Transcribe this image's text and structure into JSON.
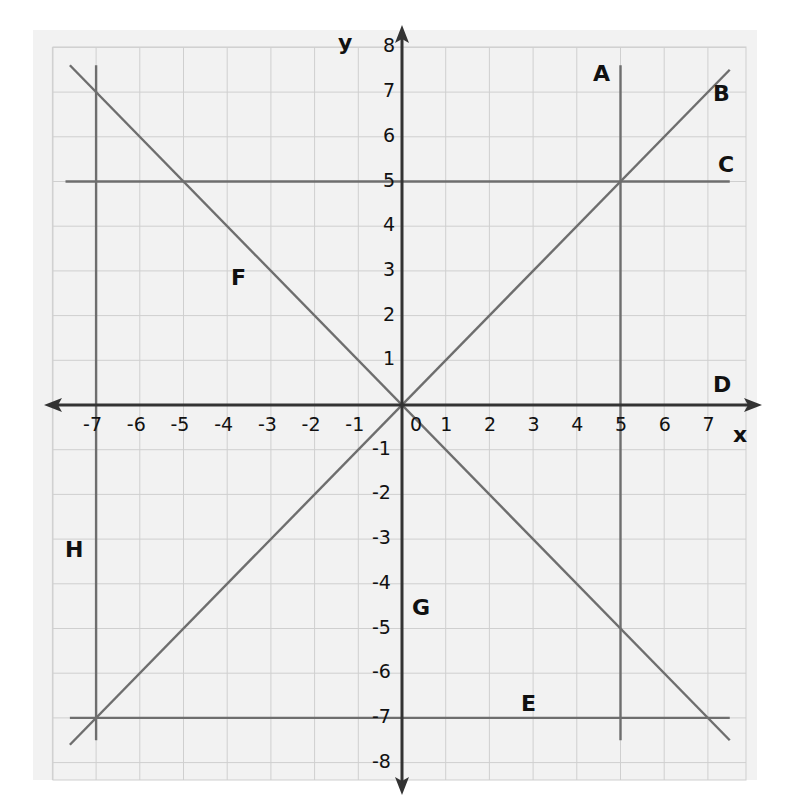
{
  "chart_data": {
    "type": "line",
    "title": "",
    "xlabel": "x",
    "ylabel": "y",
    "xlim": [
      -8,
      8
    ],
    "ylim": [
      -8,
      8
    ],
    "grid": true,
    "x_ticks": [
      "-7",
      "-6",
      "-5",
      "-4",
      "-3",
      "-2",
      "-1",
      "0",
      "1",
      "2",
      "3",
      "4",
      "5",
      "6",
      "7"
    ],
    "y_ticks": [
      "8",
      "7",
      "6",
      "5",
      "4",
      "3",
      "2",
      "1",
      "-1",
      "-2",
      "-3",
      "-4",
      "-5",
      "-6",
      "-7",
      "-8"
    ],
    "series": [
      {
        "name": "A",
        "equation": "x = 5",
        "points": [
          [
            5,
            7.6
          ],
          [
            5,
            -7.5
          ]
        ]
      },
      {
        "name": "B",
        "equation": "y = x",
        "points": [
          [
            -7.6,
            -7.6
          ],
          [
            7.5,
            7.5
          ]
        ]
      },
      {
        "name": "C",
        "equation": "y = 5",
        "points": [
          [
            -7.7,
            5
          ],
          [
            7.5,
            5
          ]
        ]
      },
      {
        "name": "D",
        "equation": "y = 0",
        "points": [
          [
            -8,
            0
          ],
          [
            8,
            0
          ]
        ]
      },
      {
        "name": "E",
        "equation": "y = -7",
        "points": [
          [
            -7.6,
            -7
          ],
          [
            7.5,
            -7
          ]
        ]
      },
      {
        "name": "F",
        "equation": "y = -x",
        "points": [
          [
            -7.6,
            7.6
          ],
          [
            7.5,
            -7.5
          ]
        ]
      },
      {
        "name": "G",
        "equation": "x = 0",
        "points": [
          [
            0,
            8
          ],
          [
            0,
            -8
          ]
        ]
      },
      {
        "name": "H",
        "equation": "x = -7",
        "points": [
          [
            -7,
            7.6
          ],
          [
            -7,
            -7.5
          ]
        ]
      }
    ]
  },
  "labels": {
    "axis_x": "x",
    "axis_y": "y",
    "A": "A",
    "B": "B",
    "C": "C",
    "D": "D",
    "E": "E",
    "F": "F",
    "G": "G",
    "H": "H"
  },
  "ticks": {
    "x": [
      "-7",
      "-6",
      "-5",
      "-4",
      "-3",
      "-2",
      "-1",
      "0",
      "1",
      "2",
      "3",
      "4",
      "5",
      "6",
      "7"
    ],
    "y": [
      "8",
      "7",
      "6",
      "5",
      "4",
      "3",
      "2",
      "1",
      "-1",
      "-2",
      "-3",
      "-4",
      "-5",
      "-6",
      "-7",
      "-8"
    ]
  },
  "colors": {
    "paper": "#f2f2f2",
    "grid": "#cfcfcf",
    "line": "#6e6e6e",
    "axis": "#333333",
    "text": "#111111"
  }
}
